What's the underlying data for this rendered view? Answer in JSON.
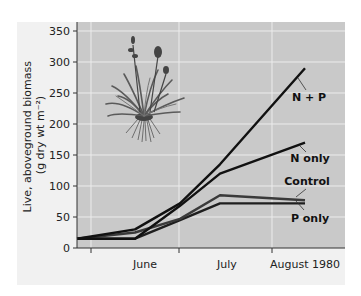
{
  "chart_data": {
    "type": "line",
    "title": "",
    "xlabel": "",
    "ylabel": "Live, aboveground biomass (g dry wt m⁻²)",
    "ylabel_lines": [
      "Live, aboveground biomass",
      "(g dry wt m⁻²)"
    ],
    "ylim": [
      0,
      350
    ],
    "yticks": [
      0,
      50,
      100,
      150,
      200,
      250,
      300,
      350
    ],
    "xtick_labels": [
      "June",
      "July",
      "August 1980"
    ],
    "grid": true,
    "legend_position": "inline labels at line ends",
    "x_positions_note": "sample points from early June to mid-August 1980",
    "x": [
      "early June",
      "mid June",
      "late June",
      "early July",
      "mid August"
    ],
    "series": [
      {
        "name": "N + P",
        "values": [
          15,
          30,
          72,
          135,
          290
        ],
        "color": "#111111"
      },
      {
        "name": "N only",
        "values": [
          15,
          15,
          68,
          120,
          170
        ],
        "color": "#111111"
      },
      {
        "name": "Control",
        "values": [
          15,
          25,
          47,
          85,
          77
        ],
        "color": "#3a3a3a"
      },
      {
        "name": "P only",
        "values": [
          15,
          15,
          45,
          72,
          72
        ],
        "color": "#1e1e1e"
      }
    ],
    "annotations": [
      "Illustration of a flowering grass-like plant with roots"
    ]
  },
  "colors": {
    "plot_bg": "#c9c9c9",
    "panel_bg": "#f1f1f1",
    "grid": "#ececec",
    "axis": "#333333"
  }
}
